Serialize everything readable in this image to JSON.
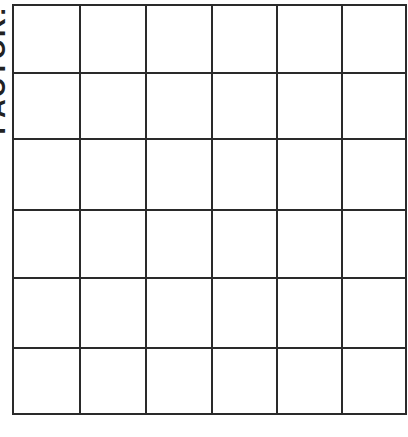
{
  "side_label": "FACTOR:",
  "grid": {
    "rows": 6,
    "cols": 6,
    "line_color": "#2a2a2a",
    "x_lines": [
      0,
      67,
      133,
      199,
      264,
      329,
      393
    ],
    "y_lines": [
      0,
      68,
      134,
      205,
      273,
      343,
      409
    ]
  }
}
